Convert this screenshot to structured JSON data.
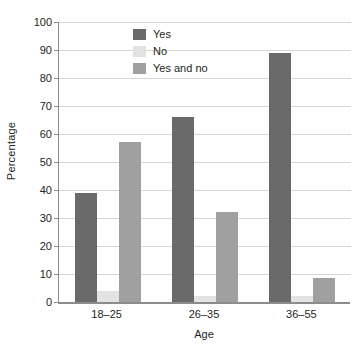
{
  "chart_data": {
    "type": "bar",
    "title": "",
    "xlabel": "Age",
    "ylabel": "Percentage",
    "categories": [
      "18–25",
      "26–35",
      "36–55"
    ],
    "series": [
      {
        "name": "Yes",
        "color": "#6a6a6a",
        "values": [
          39,
          66,
          89
        ]
      },
      {
        "name": "No",
        "color": "#e3e3e3",
        "values": [
          4,
          2,
          2
        ]
      },
      {
        "name": "Yes and no",
        "color": "#a0a0a0",
        "values": [
          57,
          32,
          8.5
        ]
      }
    ],
    "ylim": [
      0,
      100
    ],
    "yticks": [
      0,
      10,
      20,
      30,
      40,
      50,
      60,
      70,
      80,
      90,
      100
    ],
    "ytick_labels": [
      "0",
      "10",
      "20",
      "30",
      "40",
      "50",
      "60",
      "70",
      "80",
      "90",
      "100"
    ],
    "grid": "horizontal",
    "legend_position": "top-left-inside",
    "gridline_color": "#d6d6d6",
    "axis_color": "#8c8c8c",
    "background": "#ffffff"
  },
  "legend": {
    "items": [
      {
        "label": "Yes",
        "color": "#6a6a6a"
      },
      {
        "label": "No",
        "color": "#e3e3e3"
      },
      {
        "label": "Yes and no",
        "color": "#a0a0a0"
      }
    ]
  },
  "axes": {
    "y_title": "Percentage",
    "x_title": "Age"
  }
}
